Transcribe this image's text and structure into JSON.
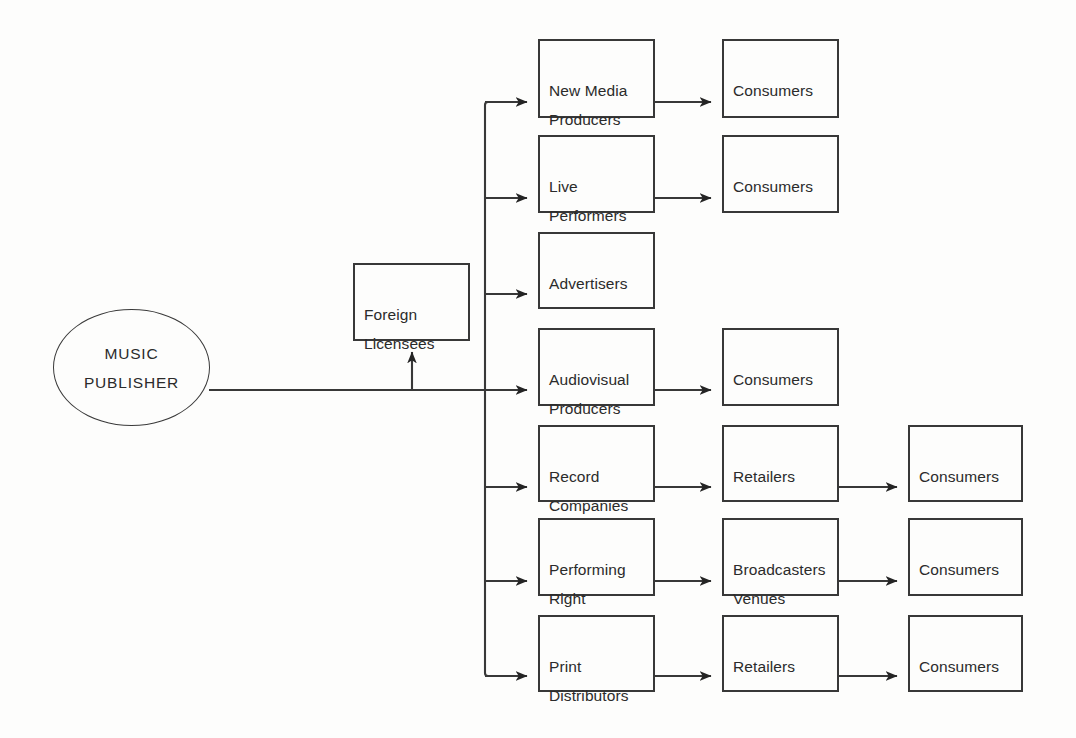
{
  "diagram": {
    "background_color": "#fdfdfc",
    "line_color": "#383838",
    "text_color": "#2b2b2b",
    "source": {
      "id": "music-publisher",
      "label": "MUSIC\nPUBLISHER",
      "shape": "ellipse",
      "x": 53,
      "y": 309,
      "w": 157,
      "h": 117
    },
    "side_node": {
      "id": "foreign-licensees",
      "label": "Foreign\nLicensees",
      "shape": "rect",
      "x": 353,
      "y": 263,
      "w": 117,
      "h": 78
    },
    "columns": [
      {
        "name": "licensee",
        "x": 538,
        "w": 117
      },
      {
        "name": "intermediary",
        "x": 722,
        "w": 117
      },
      {
        "name": "end-user",
        "x": 908,
        "w": 115
      }
    ],
    "rows": [
      {
        "index": 1,
        "y": 39,
        "h": 79,
        "licensee": "New Media\nProducers",
        "intermediary": "Consumers",
        "end_user": null
      },
      {
        "index": 2,
        "y": 135,
        "h": 78,
        "licensee": "Live\nPerformers",
        "intermediary": "Consumers",
        "end_user": null
      },
      {
        "index": 3,
        "y": 232,
        "h": 77,
        "licensee": "Advertisers",
        "intermediary": null,
        "end_user": null
      },
      {
        "index": 4,
        "y": 328,
        "h": 78,
        "licensee": "Audiovisual\nProducers",
        "intermediary": "Consumers",
        "end_user": null
      },
      {
        "index": 5,
        "y": 425,
        "h": 77,
        "licensee": "Record\nCompanies",
        "intermediary": "Retailers",
        "end_user": "Consumers"
      },
      {
        "index": 6,
        "y": 518,
        "h": 78,
        "licensee": "Performing\nRight",
        "intermediary": "Broadcasters\nVenues",
        "end_user": "Consumers"
      },
      {
        "index": 7,
        "y": 615,
        "h": 77,
        "licensee": "Print\nDistributors",
        "intermediary": "Retailers",
        "end_user": "Consumers"
      }
    ],
    "connectors": {
      "trunk_x": 485,
      "trunk_top_y": 102,
      "trunk_bottom_y": 676,
      "main_line_y": 390,
      "main_line_from_x": 209,
      "branch_arrow_tip_x": 538,
      "foreign_branch_x": 412
    }
  }
}
